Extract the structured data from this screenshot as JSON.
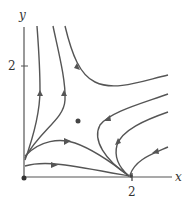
{
  "diagram": {
    "type": "phase-portrait",
    "axes": {
      "x_label": "x",
      "y_label": "y",
      "x_tick_label": "2",
      "y_tick_label": "2"
    },
    "colors": {
      "curve": "#555555",
      "axis": "#555555",
      "point": "#444444"
    },
    "equilibria": [
      {
        "name": "origin",
        "x": 0,
        "y": 0
      },
      {
        "name": "x-axis-node",
        "x": 2,
        "y": 0
      },
      {
        "name": "interior-saddle",
        "x": 1,
        "y": 1
      }
    ]
  }
}
